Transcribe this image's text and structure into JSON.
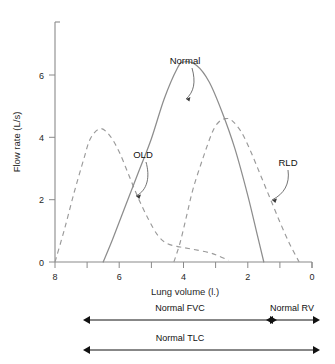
{
  "chart_data": {
    "type": "line",
    "title": "",
    "xlabel": "Lung volume (l.)",
    "ylabel": "Flow rate (L/s)",
    "xlim": [
      8,
      0
    ],
    "ylim": [
      0,
      7.2
    ],
    "x_axis_reversed": true,
    "grid": false,
    "legend": "none",
    "x_ticks": [
      8,
      7,
      6,
      5,
      4,
      3,
      2,
      1,
      0
    ],
    "x_tick_labels": [
      "8",
      "",
      "6",
      "",
      "4",
      "",
      "2",
      "",
      "0"
    ],
    "y_ticks": [
      0,
      2,
      4,
      6
    ],
    "y_tick_labels": [
      "0",
      "2",
      "4",
      "6"
    ],
    "series": [
      {
        "name": "Normal",
        "style": "solid",
        "color": "#8d8d8d",
        "peak_flow": 6.0,
        "peak_volume": 4.0,
        "start_volume": 6.5,
        "end_volume": 1.5,
        "x": [
          6.5,
          6.2,
          5.8,
          5.4,
          5.0,
          4.6,
          4.2,
          4.0,
          3.6,
          3.2,
          2.8,
          2.4,
          2.0,
          1.7,
          1.5
        ],
        "y": [
          0.0,
          0.7,
          1.7,
          2.7,
          3.7,
          4.9,
          5.8,
          6.0,
          5.9,
          5.4,
          4.5,
          3.4,
          2.0,
          0.8,
          0.0
        ]
      },
      {
        "name": "OLD",
        "style": "dashed",
        "color": "#9a9a9a",
        "peak_flow": 4.0,
        "peak_volume": 6.6,
        "start_volume": 8.0,
        "end_volume": 2.6,
        "x": [
          8.0,
          7.7,
          7.4,
          7.1,
          6.9,
          6.6,
          6.3,
          6.0,
          5.7,
          5.4,
          5.1,
          4.8,
          4.5,
          4.1,
          3.7,
          3.2,
          2.9,
          2.6
        ],
        "y": [
          0.0,
          1.0,
          2.1,
          3.1,
          3.7,
          4.0,
          3.8,
          3.3,
          2.6,
          1.9,
          1.3,
          0.8,
          0.55,
          0.45,
          0.38,
          0.28,
          0.18,
          0.05
        ]
      },
      {
        "name": "RLD",
        "style": "dashed",
        "color": "#9a9a9a",
        "peak_flow": 4.3,
        "peak_volume": 2.7,
        "start_volume": 4.3,
        "end_volume": 0.4,
        "x": [
          4.3,
          4.1,
          3.9,
          3.7,
          3.4,
          3.1,
          2.9,
          2.7,
          2.5,
          2.2,
          1.9,
          1.6,
          1.3,
          1.0,
          0.7,
          0.4
        ],
        "y": [
          0.0,
          0.6,
          1.4,
          2.2,
          3.1,
          3.9,
          4.2,
          4.3,
          4.25,
          3.9,
          3.3,
          2.6,
          1.9,
          1.2,
          0.55,
          0.0
        ]
      }
    ],
    "annotations": [
      {
        "label": "Normal",
        "points_to_series": "Normal"
      },
      {
        "label": "OLD",
        "points_to_series": "OLD"
      },
      {
        "label": "RLD",
        "points_to_series": "RLD"
      }
    ],
    "span_bars": [
      {
        "label": "Normal FVC",
        "from_volume": 6.5,
        "to_volume": 1.5,
        "arrows": "both"
      },
      {
        "label": "Normal RV",
        "from_volume": 1.5,
        "to_volume": 0.0,
        "arrows": "both"
      },
      {
        "label": "Normal TLC",
        "from_volume": 6.5,
        "to_volume": 0.0,
        "arrows": "both"
      }
    ]
  },
  "axes": {
    "y_title": "Flow rate (L/s)",
    "x_title": "Lung volume (l.)",
    "y_tick_0": "0",
    "y_tick_2": "2",
    "y_tick_4": "4",
    "y_tick_6": "6",
    "x_tick_8": "8",
    "x_tick_6": "6",
    "x_tick_4": "4",
    "x_tick_2": "2",
    "x_tick_0": "0"
  },
  "labels": {
    "normal": "Normal",
    "old": "OLD",
    "rld": "RLD"
  },
  "bars": {
    "fvc": "Normal FVC",
    "rv": "Normal RV",
    "tlc": "Normal TLC"
  }
}
